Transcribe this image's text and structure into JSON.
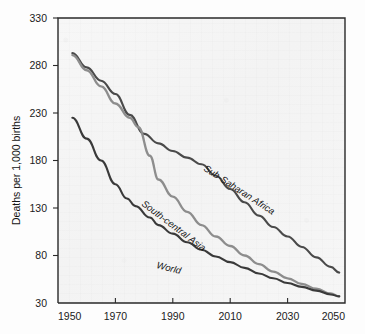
{
  "chart_data": {
    "type": "line",
    "title": "",
    "subtitle": "",
    "xlabel": "",
    "ylabel": "Deaths per 1,000 births",
    "xlim": [
      1950,
      2050
    ],
    "ylim": [
      30,
      330
    ],
    "xticks": [
      "1950",
      "1970",
      "1990",
      "2010",
      "2030",
      "2050"
    ],
    "yticks": [
      "30",
      "80",
      "130",
      "180",
      "230",
      "280",
      "330"
    ],
    "grid": false,
    "legend_position": "inline-labels",
    "series": [
      {
        "name": "Sub-Saharan Africa",
        "color": "#4a4a4a",
        "label_text": "Sub-Saharan Africa",
        "x": [
          1955,
          1960,
          1965,
          1970,
          1975,
          1980,
          1985,
          1990,
          1995,
          2000,
          2005,
          2010,
          2015,
          2020,
          2025,
          2030,
          2035,
          2040,
          2045,
          2048
        ],
        "values": [
          293,
          278,
          264,
          250,
          228,
          208,
          198,
          190,
          183,
          176,
          164,
          150,
          136,
          122,
          110,
          100,
          89,
          78,
          68,
          62
        ]
      },
      {
        "name": "South-central Asia",
        "color": "#8d8d8d",
        "label_text": "South-central Asia",
        "x": [
          1955,
          1960,
          1965,
          1970,
          1975,
          1978,
          1982,
          1985,
          1990,
          1995,
          2000,
          2005,
          2010,
          2015,
          2020,
          2025,
          2030,
          2035,
          2040,
          2045,
          2048
        ],
        "values": [
          291,
          275,
          258,
          240,
          225,
          215,
          185,
          160,
          142,
          126,
          112,
          100,
          90,
          80,
          71,
          63,
          56,
          50,
          45,
          40,
          37
        ]
      },
      {
        "name": "World",
        "color": "#3a3a3a",
        "label_text": "World",
        "x": [
          1955,
          1960,
          1965,
          1970,
          1974,
          1977,
          1982,
          1985,
          1990,
          1995,
          2000,
          2005,
          2010,
          2015,
          2020,
          2025,
          2030,
          2035,
          2040,
          2045,
          2048
        ],
        "values": [
          225,
          203,
          180,
          155,
          140,
          132,
          120,
          112,
          103,
          94,
          86,
          79,
          73,
          67,
          61,
          56,
          51,
          47,
          43,
          39,
          37
        ]
      }
    ]
  },
  "axis": {
    "y_title": "Deaths per 1,000 births",
    "y_ticks": [
      {
        "label": "330",
        "value": 330
      },
      {
        "label": "280",
        "value": 280
      },
      {
        "label": "230",
        "value": 230
      },
      {
        "label": "180",
        "value": 180
      },
      {
        "label": "130",
        "value": 130
      },
      {
        "label": "80",
        "value": 80
      },
      {
        "label": "30",
        "value": 30
      }
    ],
    "x_ticks": [
      {
        "label": "1950",
        "value": 1950
      },
      {
        "label": "1970",
        "value": 1970
      },
      {
        "label": "1990",
        "value": 1990
      },
      {
        "label": "2010",
        "value": 2010
      },
      {
        "label": "2030",
        "value": 2030
      },
      {
        "label": "2050",
        "value": 2050
      }
    ]
  },
  "series_labels": {
    "sub_saharan_africa": "Sub-Saharan Africa",
    "south_central_asia": "South-central Asia",
    "world": "World"
  },
  "colors": {
    "sub_saharan_africa": "#4a4a4a",
    "south_central_asia": "#8d8d8d",
    "world": "#3a3a3a",
    "axis": "#2a2a2a",
    "plot_background": "#f5f5f5"
  }
}
